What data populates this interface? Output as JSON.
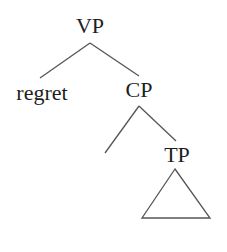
{
  "diagram": {
    "type": "syntax-tree",
    "nodes": {
      "vp": {
        "label": "VP",
        "x": 90,
        "y": 33
      },
      "regret": {
        "label": "regret",
        "x": 42,
        "y": 100
      },
      "cp": {
        "label": "CP",
        "x": 139,
        "y": 97
      },
      "empty": {
        "label": "",
        "x": 105,
        "y": 153
      },
      "tp": {
        "label": "TP",
        "x": 177,
        "y": 162
      },
      "tp_triangle": {
        "label": "",
        "apex": [
          175,
          169
        ],
        "left": [
          142,
          218
        ],
        "right": [
          210,
          218
        ]
      }
    },
    "edges": [
      {
        "from": "vp",
        "to": "regret",
        "x1": 90,
        "y1": 43,
        "x2": 40,
        "y2": 78
      },
      {
        "from": "vp",
        "to": "cp",
        "x1": 90,
        "y1": 43,
        "x2": 139,
        "y2": 76
      },
      {
        "from": "cp",
        "to": "empty",
        "x1": 139,
        "y1": 106,
        "x2": 105,
        "y2": 153
      },
      {
        "from": "cp",
        "to": "tp",
        "x1": 139,
        "y1": 106,
        "x2": 176,
        "y2": 141
      }
    ],
    "colors": {
      "text": "#1e1e1e",
      "lines": "#555555",
      "background": "#ffffff"
    }
  }
}
